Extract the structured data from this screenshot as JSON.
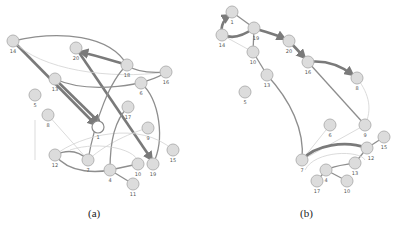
{
  "figure": {
    "panels": [
      {
        "caption": "(a)",
        "nodes": [
          {
            "id": "14",
            "x": 13,
            "y": 41
          },
          {
            "id": "20",
            "x": 76,
            "y": 48
          },
          {
            "id": "18",
            "x": 127,
            "y": 65
          },
          {
            "id": "16",
            "x": 166,
            "y": 72
          },
          {
            "id": "13",
            "x": 55,
            "y": 79
          },
          {
            "id": "6",
            "x": 141,
            "y": 83
          },
          {
            "id": "5",
            "x": 35,
            "y": 95
          },
          {
            "id": "17",
            "x": 128,
            "y": 107
          },
          {
            "id": "8",
            "x": 48,
            "y": 115
          },
          {
            "id": "1",
            "x": 98,
            "y": 127,
            "highlight": true
          },
          {
            "id": "9",
            "x": 148,
            "y": 128
          },
          {
            "id": "15",
            "x": 173,
            "y": 150
          },
          {
            "id": "12",
            "x": 55,
            "y": 155
          },
          {
            "id": "7",
            "x": 88,
            "y": 160
          },
          {
            "id": "4",
            "x": 110,
            "y": 170
          },
          {
            "id": "10",
            "x": 138,
            "y": 164
          },
          {
            "id": "19",
            "x": 153,
            "y": 164
          },
          {
            "id": "11",
            "x": 133,
            "y": 184
          }
        ]
      },
      {
        "caption": "(b)",
        "nodes": [
          {
            "id": "1",
            "x": 232,
            "y": 12
          },
          {
            "id": "14",
            "x": 222,
            "y": 35
          },
          {
            "id": "19",
            "x": 254,
            "y": 28
          },
          {
            "id": "20",
            "x": 289,
            "y": 41
          },
          {
            "id": "10",
            "x": 253,
            "y": 52
          },
          {
            "id": "16",
            "x": 308,
            "y": 62
          },
          {
            "id": "13",
            "x": 267,
            "y": 75
          },
          {
            "id": "5",
            "x": 245,
            "y": 92
          },
          {
            "id": "8",
            "x": 357,
            "y": 78
          },
          {
            "id": "6",
            "x": 330,
            "y": 125
          },
          {
            "id": "9",
            "x": 365,
            "y": 125
          },
          {
            "id": "15",
            "x": 384,
            "y": 137
          },
          {
            "id": "12",
            "x": 367,
            "y": 148
          },
          {
            "id": "7",
            "x": 302,
            "y": 160
          },
          {
            "id": "13",
            "x": 355,
            "y": 163
          },
          {
            "id": "4",
            "x": 326,
            "y": 170
          },
          {
            "id": "10",
            "x": 347,
            "y": 181
          },
          {
            "id": "17",
            "x": 317,
            "y": 181
          }
        ]
      }
    ]
  }
}
